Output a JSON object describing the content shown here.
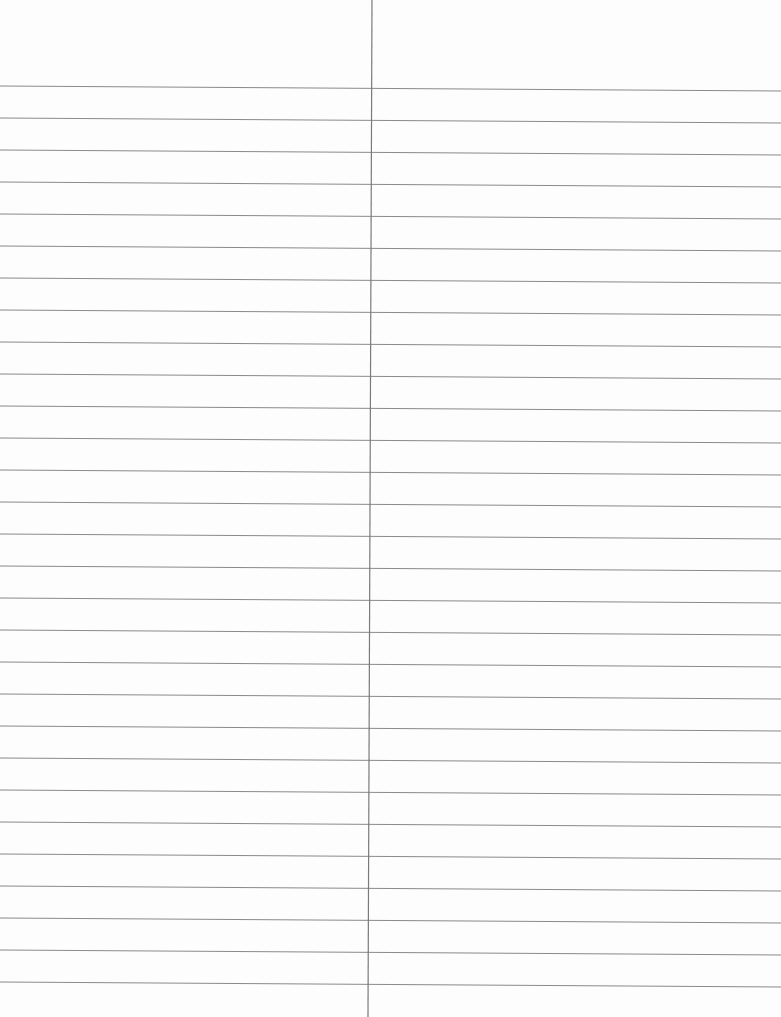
{
  "page": {
    "type": "lined-paper",
    "background_color": "#fdfdfd",
    "line_color": "#8a8a8a",
    "divider_color": "#7a7a7a",
    "line_count": 29,
    "first_line_y_left": 86,
    "first_line_y_right": 91,
    "line_spacing": 32,
    "divider_x_top": 372,
    "divider_x_bottom": 368
  }
}
